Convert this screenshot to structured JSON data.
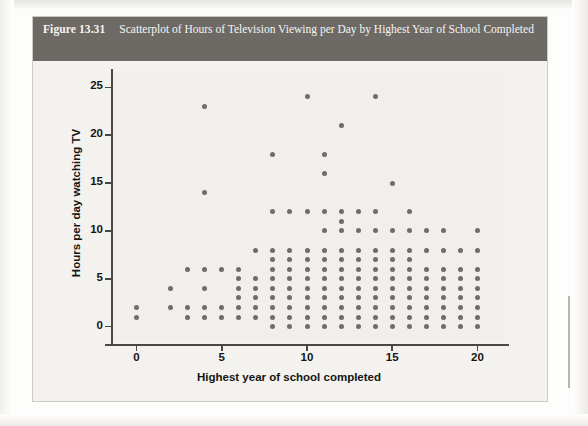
{
  "figure": {
    "number_label": "Figure 13.31",
    "caption": "Scatterplot of Hours of Television Viewing per Day by Highest Year of School Completed"
  },
  "chart_data": {
    "type": "scatter",
    "title": "Scatterplot of Hours of Television Viewing per Day by Highest Year of School Completed",
    "xlabel": "Highest year of school completed",
    "ylabel": "Hours per day watching TV",
    "xlim": [
      -1.5,
      21.5
    ],
    "ylim": [
      -1.5,
      26.5
    ],
    "xticks": [
      0,
      5,
      10,
      15,
      20
    ],
    "yticks": [
      0,
      5,
      10,
      15,
      20,
      25
    ],
    "grid": false,
    "legend": "none",
    "marker_color": "#6f6d6a",
    "points": [
      [
        0,
        2
      ],
      [
        0,
        1
      ],
      [
        2,
        4
      ],
      [
        2,
        2
      ],
      [
        3,
        6
      ],
      [
        3,
        2
      ],
      [
        3,
        1
      ],
      [
        4,
        23
      ],
      [
        4,
        14
      ],
      [
        4,
        6
      ],
      [
        4,
        4
      ],
      [
        4,
        2
      ],
      [
        4,
        1
      ],
      [
        5,
        6
      ],
      [
        5,
        2
      ],
      [
        5,
        1
      ],
      [
        6,
        6
      ],
      [
        6,
        5
      ],
      [
        6,
        4
      ],
      [
        6,
        3
      ],
      [
        6,
        2
      ],
      [
        6,
        1
      ],
      [
        7,
        8
      ],
      [
        7,
        5
      ],
      [
        7,
        4
      ],
      [
        7,
        3
      ],
      [
        7,
        2
      ],
      [
        7,
        1
      ],
      [
        8,
        18
      ],
      [
        8,
        12
      ],
      [
        8,
        8
      ],
      [
        8,
        7
      ],
      [
        8,
        6
      ],
      [
        8,
        5
      ],
      [
        8,
        4
      ],
      [
        8,
        3
      ],
      [
        8,
        2
      ],
      [
        8,
        1
      ],
      [
        8,
        0
      ],
      [
        9,
        12
      ],
      [
        9,
        8
      ],
      [
        9,
        7
      ],
      [
        9,
        6
      ],
      [
        9,
        5
      ],
      [
        9,
        4
      ],
      [
        9,
        3
      ],
      [
        9,
        2
      ],
      [
        9,
        1
      ],
      [
        9,
        0
      ],
      [
        10,
        24
      ],
      [
        10,
        12
      ],
      [
        10,
        8
      ],
      [
        10,
        7
      ],
      [
        10,
        6
      ],
      [
        10,
        5
      ],
      [
        10,
        4
      ],
      [
        10,
        3
      ],
      [
        10,
        2
      ],
      [
        10,
        1
      ],
      [
        10,
        0
      ],
      [
        11,
        18
      ],
      [
        11,
        16
      ],
      [
        11,
        12
      ],
      [
        11,
        10
      ],
      [
        11,
        8
      ],
      [
        11,
        7
      ],
      [
        11,
        6
      ],
      [
        11,
        5
      ],
      [
        11,
        4
      ],
      [
        11,
        3
      ],
      [
        11,
        2
      ],
      [
        11,
        1
      ],
      [
        11,
        0
      ],
      [
        12,
        21
      ],
      [
        12,
        12
      ],
      [
        12,
        11
      ],
      [
        12,
        10
      ],
      [
        12,
        8
      ],
      [
        12,
        7
      ],
      [
        12,
        6
      ],
      [
        12,
        5
      ],
      [
        12,
        4
      ],
      [
        12,
        3
      ],
      [
        12,
        2
      ],
      [
        12,
        1
      ],
      [
        12,
        0
      ],
      [
        13,
        12
      ],
      [
        13,
        10
      ],
      [
        13,
        8
      ],
      [
        13,
        7
      ],
      [
        13,
        6
      ],
      [
        13,
        5
      ],
      [
        13,
        4
      ],
      [
        13,
        3
      ],
      [
        13,
        2
      ],
      [
        13,
        1
      ],
      [
        13,
        0
      ],
      [
        14,
        24
      ],
      [
        14,
        12
      ],
      [
        14,
        10
      ],
      [
        14,
        8
      ],
      [
        14,
        7
      ],
      [
        14,
        6
      ],
      [
        14,
        5
      ],
      [
        14,
        4
      ],
      [
        14,
        3
      ],
      [
        14,
        2
      ],
      [
        14,
        1
      ],
      [
        14,
        0
      ],
      [
        15,
        15
      ],
      [
        15,
        10
      ],
      [
        15,
        8
      ],
      [
        15,
        7
      ],
      [
        15,
        6
      ],
      [
        15,
        5
      ],
      [
        15,
        4
      ],
      [
        15,
        3
      ],
      [
        15,
        2
      ],
      [
        15,
        1
      ],
      [
        15,
        0
      ],
      [
        16,
        12
      ],
      [
        16,
        10
      ],
      [
        16,
        8
      ],
      [
        16,
        7
      ],
      [
        16,
        6
      ],
      [
        16,
        5
      ],
      [
        16,
        4
      ],
      [
        16,
        3
      ],
      [
        16,
        2
      ],
      [
        16,
        1
      ],
      [
        16,
        0
      ],
      [
        17,
        10
      ],
      [
        17,
        8
      ],
      [
        17,
        6
      ],
      [
        17,
        5
      ],
      [
        17,
        4
      ],
      [
        17,
        3
      ],
      [
        17,
        2
      ],
      [
        17,
        1
      ],
      [
        17,
        0
      ],
      [
        18,
        10
      ],
      [
        18,
        8
      ],
      [
        18,
        6
      ],
      [
        18,
        5
      ],
      [
        18,
        4
      ],
      [
        18,
        3
      ],
      [
        18,
        2
      ],
      [
        18,
        1
      ],
      [
        18,
        0
      ],
      [
        19,
        8
      ],
      [
        19,
        6
      ],
      [
        19,
        5
      ],
      [
        19,
        4
      ],
      [
        19,
        3
      ],
      [
        19,
        2
      ],
      [
        19,
        1
      ],
      [
        19,
        0
      ],
      [
        20,
        10
      ],
      [
        20,
        8
      ],
      [
        20,
        6
      ],
      [
        20,
        5
      ],
      [
        20,
        4
      ],
      [
        20,
        3
      ],
      [
        20,
        2
      ],
      [
        20,
        1
      ],
      [
        20,
        0
      ]
    ]
  }
}
